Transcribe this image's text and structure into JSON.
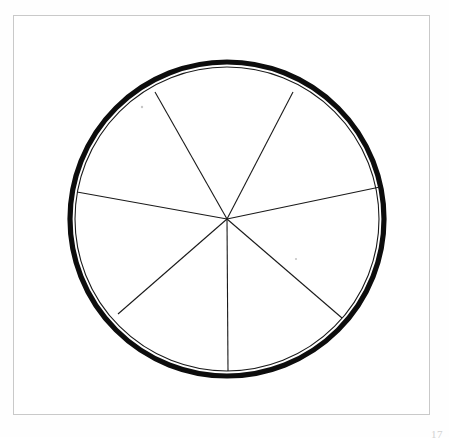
{
  "plate": {
    "background_color": "#fefefe",
    "frame_color": "#c9c9c9",
    "page_number": "17"
  },
  "figure": {
    "ink_color": "#1a1a1a",
    "rim_color": "#0d0d0d",
    "fill_color": "#ffffff"
  },
  "chart_data": {
    "type": "pie",
    "center_x": 227,
    "center_y": 219,
    "radius": 155,
    "rim_outer_radius": 157,
    "rim_stroke_width": 5.2,
    "inner_circle_radius": 152,
    "legend": "none",
    "grid": "off",
    "units": "degrees",
    "categories": [
      "sector-1",
      "sector-2",
      "sector-3",
      "sector-4",
      "sector-5",
      "sector-6",
      "sector-7"
    ],
    "spoke_angles_deg": [
      120.6,
      62.3,
      11.8,
      -40.9,
      -89.6,
      -139.1,
      169.8
    ],
    "spoke_endpoints": [
      {
        "name": "upper-left",
        "x": 155,
        "y": 92
      },
      {
        "name": "upper-right",
        "x": 293,
        "y": 92
      },
      {
        "name": "right",
        "x": 380,
        "y": 187
      },
      {
        "name": "lower-right",
        "x": 342,
        "y": 318
      },
      {
        "name": "bottom",
        "x": 228,
        "y": 371
      },
      {
        "name": "lower-left",
        "x": 118,
        "y": 314
      },
      {
        "name": "left",
        "x": 77,
        "y": 192
      }
    ],
    "values": [
      58.3,
      50.5,
      52.7,
      48.7,
      49.5,
      51.1,
      48.6
    ],
    "xlabel": "",
    "ylabel": "",
    "annotations": []
  },
  "specks": [
    {
      "x": 142,
      "y": 107,
      "r": 1.2
    },
    {
      "x": 296,
      "y": 259,
      "r": 1.1
    }
  ]
}
